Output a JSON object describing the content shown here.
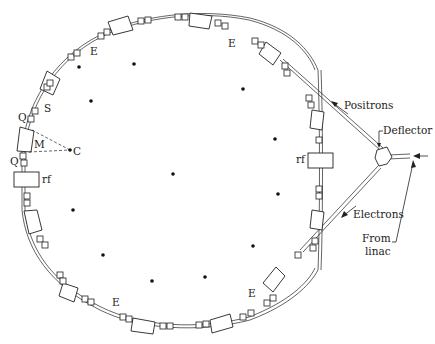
{
  "diagram": {
    "type": "storage-ring schematic",
    "ring_center": [
      172,
      172
    ],
    "labels": {
      "E_top_left": "E",
      "E_top_right": "E",
      "E_bottom_left": "E",
      "E_bottom_right": "E",
      "S": "S",
      "Q_upper": "Q",
      "Q_lower": "Q",
      "M": "M",
      "C": "C",
      "rf_left": "rf",
      "rf_right": "rf",
      "positrons": "Positrons",
      "electrons": "Electrons",
      "deflector": "Deflector",
      "from_linac_1": "From",
      "from_linac_2": "linac"
    },
    "interior_dots": [
      [
        79,
        67
      ],
      [
        134,
        64
      ],
      [
        91,
        101
      ],
      [
        243,
        89
      ],
      [
        275,
        139
      ],
      [
        173,
        174
      ],
      [
        278,
        194
      ],
      [
        73,
        210
      ],
      [
        103,
        255
      ],
      [
        253,
        246
      ],
      [
        152,
        281
      ],
      [
        205,
        277
      ]
    ],
    "colors": {
      "ink": "#222222",
      "background": "#ffffff"
    }
  }
}
